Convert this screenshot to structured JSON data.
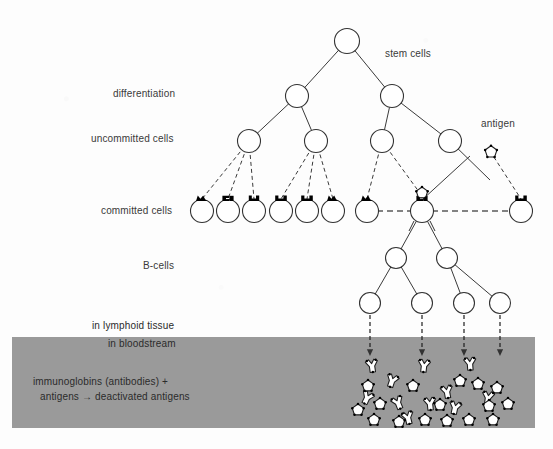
{
  "figure": {
    "title": "",
    "background_color": "#fdfdfd",
    "band_color": "#9a9a9a",
    "stroke_color": "#333333",
    "receptor_color": "#000000"
  },
  "labels": {
    "stem_cells": "stem cells",
    "differentiation": "differentiation",
    "uncommitted_cells": "uncommitted cells",
    "committed_cells": "committed cells",
    "antigen": "antigen",
    "b_cells": "B-cells",
    "in_lymphoid_tissue": "in lymphoid tissue",
    "in_bloodstream": "in bloodstream",
    "reaction_line1": "immunoglobins (antibodies) +",
    "reaction_line2": "antigens → deactivated antigens"
  },
  "diagram_data": {
    "type": "tree-diagram",
    "rows": [
      {
        "name": "stem-cell-row",
        "y": 41,
        "label": "stem cells",
        "cell_radius": 12.5
      },
      {
        "name": "differentiation-row",
        "y": 96,
        "label": "differentiation",
        "cell_radius": 11.5
      },
      {
        "name": "uncommitted-row",
        "y": 141,
        "label": "uncommitted cells",
        "cell_radius": 11.5
      },
      {
        "name": "committed-row",
        "y": 211,
        "label": "committed cells",
        "cell_radius": 11.5
      },
      {
        "name": "bcell-upper-row",
        "y": 258,
        "label": "B-cells",
        "cell_radius": 10.5
      },
      {
        "name": "bcell-lower-row",
        "y": 303,
        "label": "",
        "cell_radius": 10.5
      }
    ],
    "nodes": {
      "stem": [
        347
      ],
      "differentiation": [
        297,
        392
      ],
      "uncommitted": [
        249,
        316,
        382,
        450
      ],
      "committed": [
        202,
        228,
        254,
        281,
        307,
        333,
        367,
        422,
        521
      ],
      "bcell_upper": [
        396,
        447
      ],
      "bcell_lower": [
        370,
        422,
        464,
        500
      ]
    },
    "edges_solid": [
      [
        347,
        41,
        297,
        96
      ],
      [
        347,
        41,
        392,
        96
      ],
      [
        297,
        96,
        249,
        141
      ],
      [
        297,
        96,
        316,
        141
      ],
      [
        392,
        96,
        382,
        141
      ],
      [
        392,
        96,
        450,
        141
      ],
      [
        422,
        211,
        396,
        258
      ],
      [
        422,
        211,
        447,
        258
      ],
      [
        396,
        258,
        370,
        303
      ],
      [
        396,
        258,
        422,
        303
      ],
      [
        447,
        258,
        464,
        303
      ],
      [
        447,
        258,
        500,
        303
      ],
      [
        450,
        141,
        490,
        180
      ],
      [
        470,
        156,
        422,
        200
      ]
    ],
    "edges_dashed": [
      [
        249,
        141,
        202,
        199
      ],
      [
        249,
        141,
        228,
        199
      ],
      [
        249,
        141,
        254,
        199
      ],
      [
        316,
        141,
        281,
        199
      ],
      [
        316,
        141,
        307,
        199
      ],
      [
        316,
        141,
        333,
        199
      ],
      [
        382,
        141,
        367,
        199
      ],
      [
        382,
        141,
        422,
        196
      ],
      [
        490,
        151,
        521,
        199
      ]
    ],
    "dashed_horizontal": [
      [
        367,
        211,
        422,
        211
      ],
      [
        422,
        211,
        521,
        211
      ]
    ],
    "fall_arrows": [
      [
        370,
        315,
        370,
        356
      ],
      [
        422,
        315,
        422,
        356
      ],
      [
        464,
        315,
        464,
        356
      ],
      [
        500,
        315,
        500,
        356
      ]
    ],
    "band": {
      "x": 12,
      "y": 337,
      "width": 523,
      "height": 91
    },
    "antigen_marker": {
      "x": 491,
      "y": 152
    },
    "bound_antigen_marker": {
      "x": 422,
      "y": 193
    },
    "receptor_count": 9,
    "bloodstream_antibodies": 11,
    "bloodstream_antigens": 16
  }
}
